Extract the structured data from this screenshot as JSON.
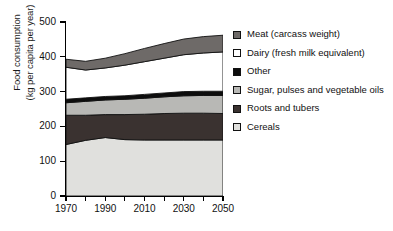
{
  "chart_data": {
    "type": "area",
    "stacked": true,
    "title": "",
    "xlabel": "",
    "ylabel": "Food consumption (kg per capita per year)",
    "ylabel_lines": [
      "Food consumption",
      "(kg per capita per year)"
    ],
    "xlim": [
      1970,
      2050
    ],
    "ylim": [
      0,
      500
    ],
    "ytick_labels": [
      "0",
      "100",
      "200",
      "300",
      "400",
      "500"
    ],
    "ytick_values": [
      0,
      100,
      200,
      300,
      400,
      500
    ],
    "xtick_values": [
      1970,
      1980,
      1990,
      2000,
      2010,
      2020,
      2030,
      2040,
      2050
    ],
    "xtick_labels": [
      "1970",
      "",
      "1990",
      "",
      "2010",
      "",
      "2030",
      "",
      "2050"
    ],
    "grid": false,
    "legend_position": "right",
    "x": [
      1970,
      1980,
      1990,
      2000,
      2010,
      2020,
      2030,
      2040,
      2050
    ],
    "series": [
      {
        "name": "Cereals",
        "color": "#e0e0dd",
        "values": [
          148,
          160,
          168,
          162,
          161,
          161,
          161,
          161,
          161
        ]
      },
      {
        "name": "Roots and tubers",
        "color": "#3a3230",
        "values": [
          84,
          72,
          66,
          72,
          74,
          76,
          77,
          77,
          76
        ]
      },
      {
        "name": "Sugar, pulses and vegetable oils",
        "color": "#b8b8b5",
        "values": [
          36,
          40,
          42,
          44,
          46,
          48,
          50,
          51,
          52
        ]
      },
      {
        "name": "Other",
        "color": "#0d0d0d",
        "values": [
          10,
          10,
          10,
          10,
          11,
          11,
          12,
          12,
          12
        ]
      },
      {
        "name": "Dairy (fresh milk equivalent)",
        "color": "#ffffff",
        "values": [
          92,
          80,
          82,
          88,
          94,
          100,
          106,
          110,
          113
        ]
      },
      {
        "name": "Meat (carcass weight)",
        "color": "#6e6a68",
        "values": [
          23,
          25,
          28,
          33,
          38,
          42,
          45,
          47,
          48
        ]
      }
    ],
    "stack_tops": {
      "cereals": [
        148,
        160,
        168,
        162,
        161,
        161,
        161,
        161,
        161
      ],
      "roots": [
        232,
        232,
        234,
        234,
        235,
        237,
        238,
        238,
        237
      ],
      "sugar": [
        268,
        272,
        276,
        278,
        281,
        285,
        288,
        289,
        289
      ],
      "other": [
        278,
        282,
        286,
        288,
        292,
        296,
        300,
        301,
        301
      ],
      "dairy": [
        370,
        362,
        368,
        376,
        386,
        396,
        406,
        411,
        414
      ],
      "meat": [
        393,
        387,
        396,
        409,
        424,
        438,
        451,
        458,
        462
      ]
    }
  },
  "legend": {
    "items": [
      {
        "label": "Meat (carcass weight)",
        "color": "#6e6a68",
        "swatch_icon": "legend-swatch-icon"
      },
      {
        "label": "Dairy (fresh milk equivalent)",
        "color": "#ffffff",
        "swatch_icon": "legend-swatch-icon"
      },
      {
        "label": "Other",
        "color": "#0d0d0d",
        "swatch_icon": "legend-swatch-icon"
      },
      {
        "label": "Sugar, pulses and vegetable oils",
        "color": "#b8b8b5",
        "swatch_icon": "legend-swatch-icon"
      },
      {
        "label": "Roots and tubers",
        "color": "#3a3230",
        "swatch_icon": "legend-swatch-icon"
      },
      {
        "label": "Cereals",
        "color": "#e0e0dd",
        "swatch_icon": "legend-swatch-icon"
      }
    ]
  }
}
